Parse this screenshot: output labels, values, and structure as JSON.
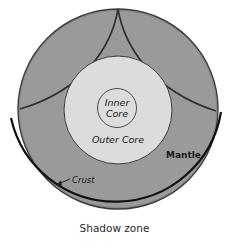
{
  "diagram": {
    "labels": {
      "inner_core": [
        "Inner",
        "Core"
      ],
      "outer_core": "Outer Core",
      "mantle": "Mantle",
      "crust": "Crust"
    },
    "caption": "Shadow zone",
    "colors": {
      "mantle_fill": "#9a9a9a",
      "outer_core_fill": "#dcdcdc",
      "inner_core_fill": "#dcdcdc",
      "outline": "#3c3c3c",
      "ray": "#2f2f2f",
      "shadow_arc": "#111111",
      "background": "#ffffff"
    }
  }
}
